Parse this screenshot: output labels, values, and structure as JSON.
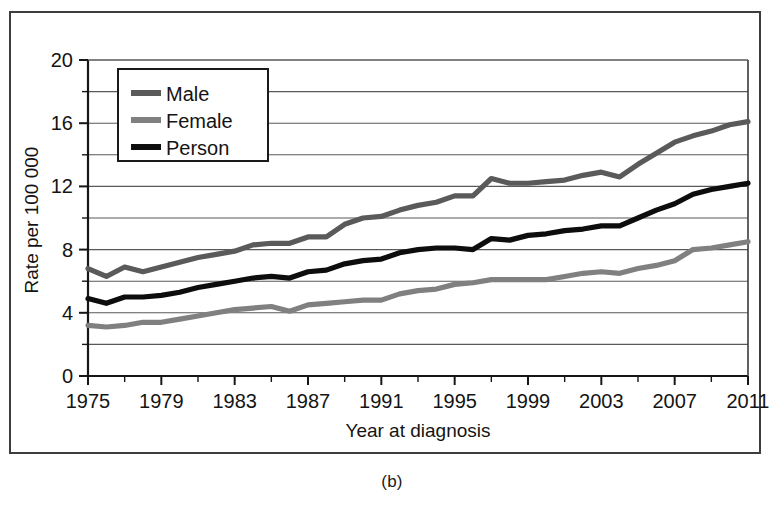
{
  "figure": {
    "caption": "(b)",
    "frame_color": "#3d3d3d"
  },
  "chart_data": {
    "type": "line",
    "title": "",
    "subtitle": "",
    "xlabel": "Year at diagnosis",
    "ylabel": "Rate per 100 000",
    "xlim": [
      1975,
      2011
    ],
    "ylim": [
      0,
      20
    ],
    "grid": "horizontal",
    "grid_step": 2,
    "y_tick_labels": [
      "0",
      "4",
      "8",
      "12",
      "16",
      "20"
    ],
    "y_tick_values": [
      0,
      4,
      8,
      12,
      16,
      20
    ],
    "y_minor_step": 2,
    "x_tick_labels": [
      "1975",
      "1979",
      "1983",
      "1987",
      "1991",
      "1995",
      "1999",
      "2003",
      "2007",
      "2011"
    ],
    "x_tick_values": [
      1975,
      1979,
      1983,
      1987,
      1991,
      1995,
      1999,
      2003,
      2007,
      2011
    ],
    "x_minor_step": 2,
    "legend_position": "top-left",
    "x": [
      1975,
      1976,
      1977,
      1978,
      1979,
      1980,
      1981,
      1982,
      1983,
      1984,
      1985,
      1986,
      1987,
      1988,
      1989,
      1990,
      1991,
      1992,
      1993,
      1994,
      1995,
      1996,
      1997,
      1998,
      1999,
      2000,
      2001,
      2002,
      2003,
      2004,
      2005,
      2006,
      2007,
      2008,
      2009,
      2010,
      2011
    ],
    "series": [
      {
        "name": "Male",
        "color": "#5a5a5a",
        "values": [
          6.8,
          6.3,
          6.9,
          6.6,
          6.9,
          7.2,
          7.5,
          7.7,
          7.9,
          8.3,
          8.4,
          8.4,
          8.8,
          8.8,
          9.6,
          10.0,
          10.1,
          10.5,
          10.8,
          11.0,
          11.4,
          11.4,
          12.5,
          12.2,
          12.2,
          12.3,
          12.4,
          12.7,
          12.9,
          12.6,
          13.4,
          14.1,
          14.8,
          15.2,
          15.5,
          15.9,
          16.1
        ]
      },
      {
        "name": "Female",
        "color": "#808080",
        "values": [
          3.2,
          3.1,
          3.2,
          3.4,
          3.4,
          3.6,
          3.8,
          4.0,
          4.2,
          4.3,
          4.4,
          4.1,
          4.5,
          4.6,
          4.7,
          4.8,
          4.8,
          5.2,
          5.4,
          5.5,
          5.8,
          5.9,
          6.1,
          6.1,
          6.1,
          6.1,
          6.3,
          6.5,
          6.6,
          6.5,
          6.8,
          7.0,
          7.3,
          8.0,
          8.1,
          8.3,
          8.5
        ]
      },
      {
        "name": "Person",
        "color": "#0d0d0d",
        "values": [
          4.9,
          4.6,
          5.0,
          5.0,
          5.1,
          5.3,
          5.6,
          5.8,
          6.0,
          6.2,
          6.3,
          6.2,
          6.6,
          6.7,
          7.1,
          7.3,
          7.4,
          7.8,
          8.0,
          8.1,
          8.1,
          8.0,
          8.7,
          8.6,
          8.9,
          9.0,
          9.2,
          9.3,
          9.5,
          9.5,
          10.0,
          10.5,
          10.9,
          11.5,
          11.8,
          12.0,
          12.2
        ]
      }
    ]
  }
}
